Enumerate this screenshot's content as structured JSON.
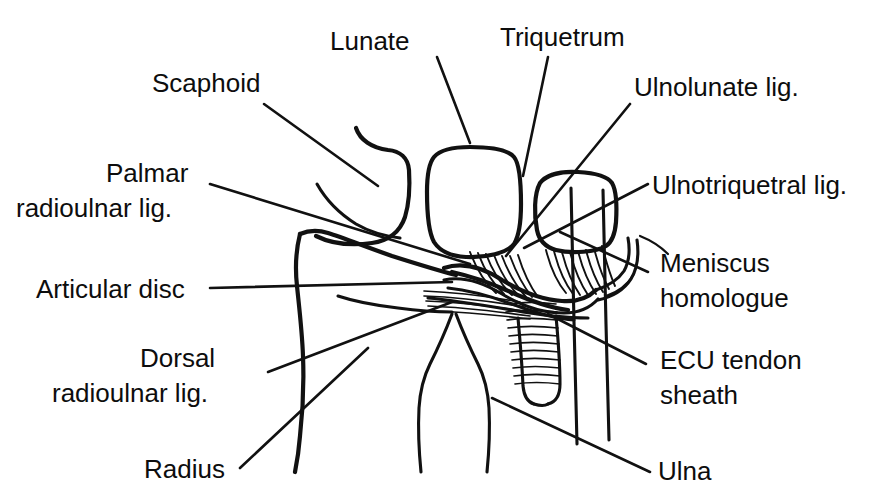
{
  "figure": {
    "style": "black-and-white anatomical line diagram with leader lines",
    "background_color": "#ffffff",
    "ink_color": "#111111",
    "width": 872,
    "height": 501
  },
  "labels": {
    "scaphoid": "Scaphoid",
    "lunate": "Lunate",
    "triquetrum": "Triquetrum",
    "ulnolunate_lig": "Ulnolunate lig.",
    "ulnotriquetral_lig": "Ulnotriquetral lig.",
    "palmar_radioulnar_lig_line1": "Palmar",
    "palmar_radioulnar_lig_line2": "radioulnar lig.",
    "articular_disc": "Articular disc",
    "dorsal_radioulnar_lig_line1": "Dorsal",
    "dorsal_radioulnar_lig_line2": "radioulnar lig.",
    "radius": "Radius",
    "meniscus_homologue_line1": "Meniscus",
    "meniscus_homologue_line2": "homologue",
    "ecu_tendon_sheath_line1": "ECU tendon",
    "ecu_tendon_sheath_line2": "sheath",
    "ulna": "Ulna"
  },
  "structures": [
    {
      "id": "scaphoid",
      "name": "Scaphoid",
      "kind": "carpal-bone"
    },
    {
      "id": "lunate",
      "name": "Lunate",
      "kind": "carpal-bone"
    },
    {
      "id": "triquetrum",
      "name": "Triquetrum",
      "kind": "carpal-bone"
    },
    {
      "id": "radius",
      "name": "Radius",
      "kind": "forearm-bone"
    },
    {
      "id": "ulna",
      "name": "Ulna",
      "kind": "forearm-bone"
    },
    {
      "id": "articular-disc",
      "name": "Articular disc",
      "kind": "fibrocartilage"
    },
    {
      "id": "palmar-radioulnar-lig",
      "name": "Palmar radioulnar lig.",
      "kind": "ligament"
    },
    {
      "id": "dorsal-radioulnar-lig",
      "name": "Dorsal radioulnar lig.",
      "kind": "ligament"
    },
    {
      "id": "ulnolunate-lig",
      "name": "Ulnolunate lig.",
      "kind": "ligament"
    },
    {
      "id": "ulnotriquetral-lig",
      "name": "Ulnotriquetral lig.",
      "kind": "ligament"
    },
    {
      "id": "meniscus-homologue",
      "name": "Meniscus homologue",
      "kind": "soft-tissue"
    },
    {
      "id": "ecu-tendon-sheath",
      "name": "ECU tendon sheath",
      "kind": "tendon-sheath"
    }
  ]
}
